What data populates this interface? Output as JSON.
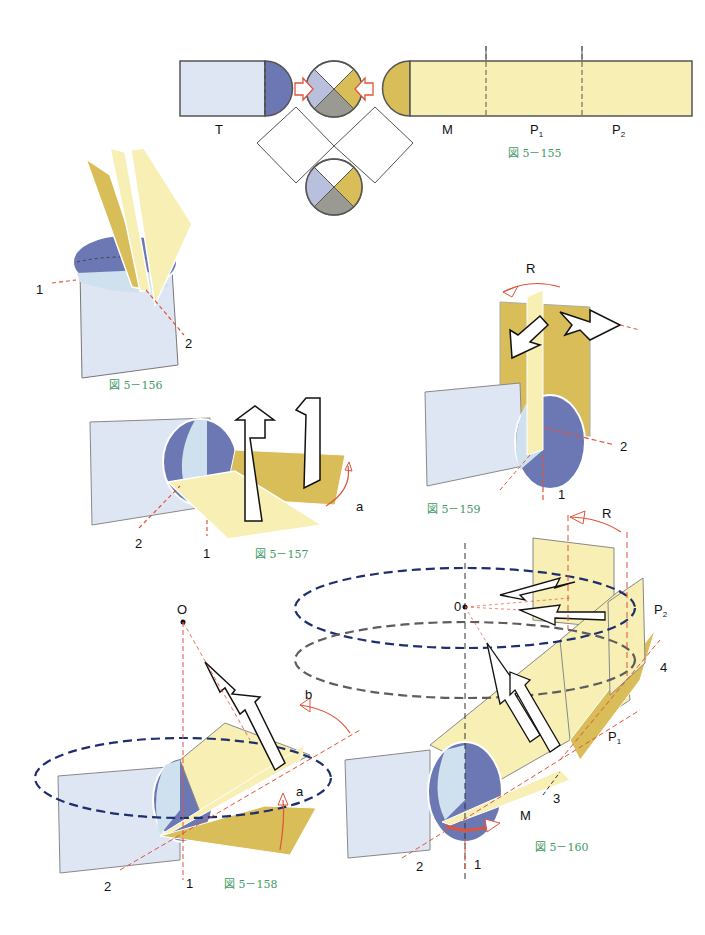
{
  "colors": {
    "light_blue": "#dfe6f3",
    "blue": "#6b78b4",
    "pale_blue": "#b9c0dd",
    "ice": "#cfe1ee",
    "yellow": "#f7efb4",
    "gold": "#d9bd58",
    "gray": "#9a9a92",
    "red": "#e0533a",
    "navy_dash": "#1d2f6e",
    "gray_dash": "#5d5d5d",
    "caption_green": "#3f9a63"
  },
  "fig155": {
    "caption": "図 5－155",
    "labels": {
      "T": "T",
      "M": "M",
      "P1": "P",
      "P1_sub": "1",
      "P2": "P",
      "P2_sub": "2"
    }
  },
  "fig156": {
    "caption": "図 5－156",
    "axis_labels": {
      "one": "1",
      "two": "2"
    }
  },
  "fig157": {
    "caption": "図 5－157",
    "axis_labels": {
      "one": "1",
      "two": "2",
      "a": "a"
    }
  },
  "fig158": {
    "caption": "図 5－158",
    "axis_labels": {
      "O": "O",
      "one": "1",
      "two": "2",
      "a": "a",
      "b": "b"
    }
  },
  "fig159": {
    "caption": "図 5－159",
    "axis_labels": {
      "R": "R",
      "one": "1",
      "two": "2"
    }
  },
  "fig160": {
    "caption": "図 5－160",
    "axis_labels": {
      "zero": "0",
      "R": "R",
      "P2": "P",
      "P2_sub": "2",
      "P1": "P",
      "P1_sub": "1",
      "M": "M",
      "one": "1",
      "two": "2",
      "three": "3",
      "four": "4"
    }
  }
}
